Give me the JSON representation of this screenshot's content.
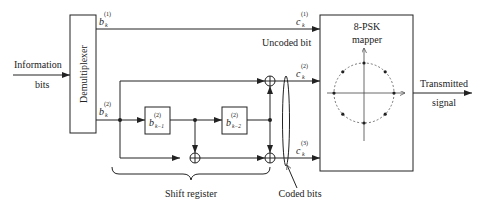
{
  "diagram": {
    "input_label_line1": "Information",
    "input_label_line2": "bits",
    "demux_label": "Demultiplexer",
    "signals": {
      "b1_base": "b",
      "b1_sub": "k",
      "b1_sup": "(1)",
      "b2_base": "b",
      "b2_sub": "k",
      "b2_sup": "(2)",
      "c1_base": "c",
      "c1_sub": "k",
      "c1_sup": "(1)",
      "c2_base": "c",
      "c2_sub": "k",
      "c2_sup": "(2)",
      "c3_base": "c",
      "c3_sub": "k",
      "c3_sup": "(3)"
    },
    "registers": [
      {
        "base": "b",
        "sub": "k−1",
        "sup": "(2)"
      },
      {
        "base": "b",
        "sub": "k−2",
        "sup": "(2)"
      }
    ],
    "uncoded_label": "Uncoded bit",
    "shift_register_label": "Shift register",
    "coded_bits_label": "Coded bits",
    "mapper_label_line1": "8-PSK",
    "mapper_label_line2": "mapper",
    "output_label_line1": "Transmitted",
    "output_label_line2": "signal",
    "constellation_points": 8,
    "colors": {
      "line": "#222222",
      "dashed_circle": "#555555"
    }
  }
}
